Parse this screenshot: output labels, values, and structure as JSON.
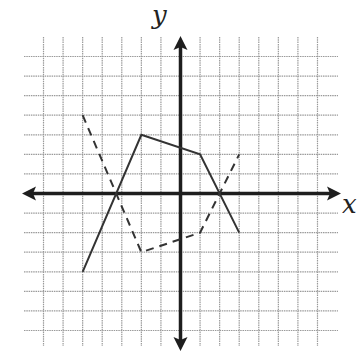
{
  "axes": {
    "x_label": "x",
    "y_label": "y"
  },
  "grid": {
    "min": -7,
    "max": 7,
    "step": 1,
    "line_color": "#9a9a9a",
    "axis_color": "#1e1e1e"
  },
  "chart_data": {
    "type": "line",
    "title": "",
    "xlabel": "x",
    "ylabel": "y",
    "xlim": [
      -7,
      7
    ],
    "ylim": [
      -7,
      7
    ],
    "grid": true,
    "ticks_labeled": false,
    "series": [
      {
        "name": "solid",
        "style": "solid",
        "points": [
          [
            -5,
            -4
          ],
          [
            -2,
            3
          ],
          [
            1,
            2
          ],
          [
            3,
            -2
          ]
        ]
      },
      {
        "name": "dashed",
        "style": "dashed",
        "points": [
          [
            -5,
            4
          ],
          [
            -2,
            -3
          ],
          [
            1,
            -2
          ],
          [
            3,
            2
          ]
        ]
      }
    ]
  }
}
